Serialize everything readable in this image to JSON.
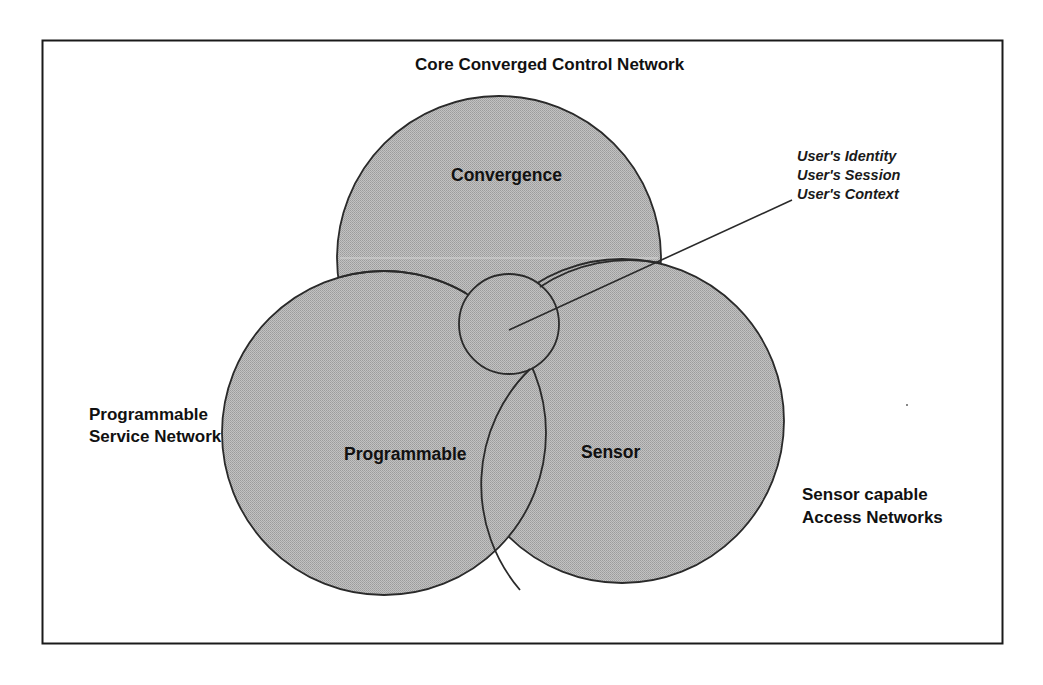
{
  "diagram": {
    "title": "Core Converged Control Network",
    "circles": [
      {
        "id": "convergence",
        "label": "Convergence",
        "cx": 499,
        "cy": 258,
        "r": 162
      },
      {
        "id": "programmable",
        "label": "Programmable",
        "cx": 384,
        "cy": 433,
        "r": 162
      },
      {
        "id": "sensor",
        "label": "Sensor",
        "cx": 622,
        "cy": 421,
        "r": 162
      },
      {
        "id": "core-intersection",
        "label": "",
        "cx": 509,
        "cy": 324,
        "r": 50
      }
    ],
    "outer_labels": {
      "programmable_network": [
        "Programmable",
        "Service Network"
      ],
      "sensor_network": [
        "Sensor capable",
        "Access Networks"
      ]
    },
    "callout": {
      "lines": [
        "User's Identity",
        "User's Session",
        "User's Context"
      ],
      "pointer": {
        "x1": 509,
        "y1": 330,
        "x2": 792,
        "y2": 200
      }
    },
    "colors": {
      "fill": "#b4b4b4",
      "stroke": "#2a2a2a",
      "frame": "#1a1a1a",
      "background": "#ffffff"
    }
  }
}
